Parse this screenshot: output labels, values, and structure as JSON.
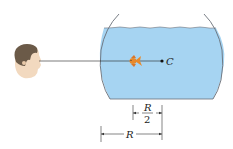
{
  "figure": {
    "type": "physics-optics-diagram",
    "labels": {
      "center": "C",
      "fraction_numerator": "R",
      "fraction_denominator": "2",
      "radius": "R"
    },
    "dimensions": [
      {
        "name": "fish-to-center",
        "label": "R/2"
      },
      {
        "name": "wall-to-center",
        "label": "R"
      }
    ],
    "colors": {
      "water": "#a6d4f2",
      "bowl_outline": "#6a6f78",
      "fish": "#e8892b",
      "skin": "#f2d9bf",
      "hair": "#6b5a48",
      "line": "#222222"
    }
  }
}
